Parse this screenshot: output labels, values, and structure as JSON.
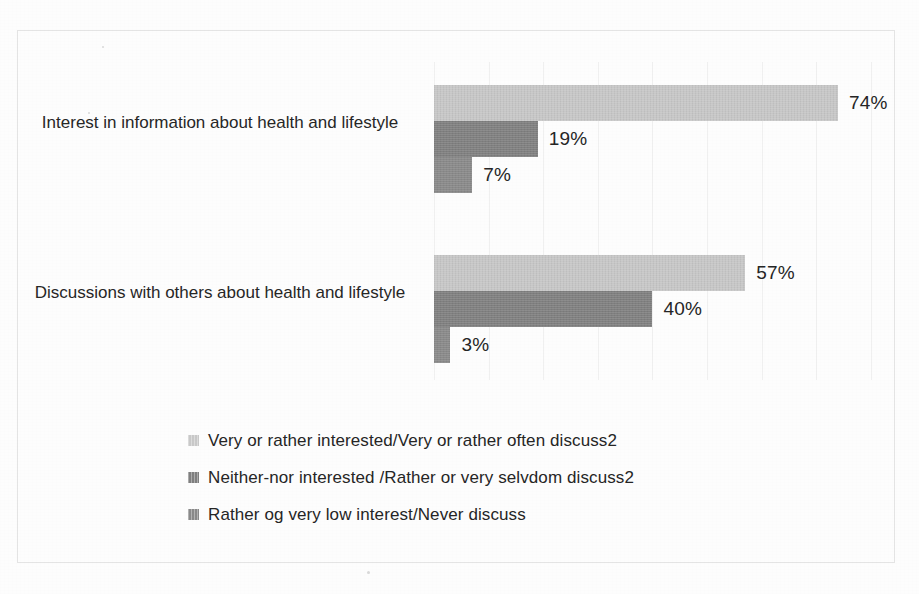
{
  "chart_data": {
    "type": "bar",
    "orientation": "horizontal",
    "title": "",
    "subtitle": "",
    "xlabel": "",
    "ylabel": "",
    "xlim": [
      0,
      80
    ],
    "grid": true,
    "gridline_interval": 10,
    "legend_position": "bottom-left",
    "value_suffix": "%",
    "categories": [
      "Interest in information about health and lifestyle",
      "Discussions with others about health and lifestyle"
    ],
    "series": [
      {
        "name": "Very or rather interested/Very or rather often discuss2",
        "color": "#c9c9c9",
        "values": [
          74,
          57
        ],
        "labels": [
          "74%",
          "57%"
        ]
      },
      {
        "name": "Neither-nor interested /Rather or very selvdom discuss2",
        "color": "#808080",
        "values": [
          19,
          40
        ],
        "labels": [
          "19%",
          "40%"
        ]
      },
      {
        "name": "Rather og very low interest/Never discuss",
        "color": "#8a8a8a",
        "values": [
          7,
          3
        ],
        "labels": [
          "7%",
          "3%"
        ]
      }
    ]
  },
  "legend": {
    "items": [
      {
        "label": "Very or rather interested/Very or rather often discuss2",
        "color": "#c9c9c9"
      },
      {
        "label": "Neither-nor interested /Rather or very selvdom discuss2",
        "color": "#808080"
      },
      {
        "label": "Rather og very low interest/Never discuss",
        "color": "#8a8a8a"
      }
    ]
  },
  "axis": {
    "category_labels": [
      "Interest in information about health and lifestyle",
      "Discussions with others about health and lifestyle"
    ]
  },
  "colors": {
    "series_1": "#c9c9c9",
    "series_2": "#808080",
    "series_3": "#8a8a8a",
    "gridline": "#f0f0f0",
    "frame": "#e4e4e4",
    "text": "#262626",
    "background": "#fdfdfd"
  }
}
